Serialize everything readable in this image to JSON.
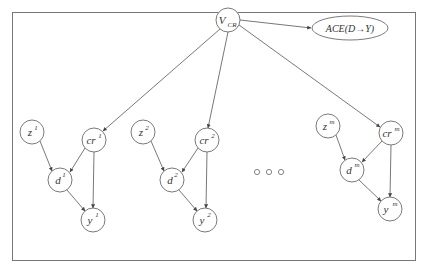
{
  "diagram": {
    "type": "causal-graph",
    "root": {
      "id": "vcr",
      "label": "V",
      "sub": "CR"
    },
    "target": {
      "id": "ace",
      "label": "ACE(D→Y)"
    },
    "groups": [
      {
        "z": {
          "base": "z",
          "sup": "1"
        },
        "cr": {
          "base": "cr",
          "sup": "1"
        },
        "d": {
          "base": "d",
          "sup": "1"
        },
        "y": {
          "base": "y",
          "sup": "1"
        }
      },
      {
        "z": {
          "base": "z",
          "sup": "2"
        },
        "cr": {
          "base": "cr",
          "sup": "2"
        },
        "d": {
          "base": "d",
          "sup": "2"
        },
        "y": {
          "base": "y",
          "sup": "2"
        }
      },
      {
        "z": {
          "base": "z",
          "sup": "m"
        },
        "cr": {
          "base": "cr",
          "sup": "m"
        },
        "d": {
          "base": "d",
          "sup": "m"
        },
        "y": {
          "base": "y",
          "sup": "m"
        }
      }
    ],
    "ellipsis": "○ ○ ○",
    "edges": [
      [
        "V_CR",
        "ACE(D→Y)"
      ],
      [
        "V_CR",
        "cr^1"
      ],
      [
        "V_CR",
        "cr^2"
      ],
      [
        "V_CR",
        "cr^m"
      ],
      [
        "z^1",
        "d^1"
      ],
      [
        "cr^1",
        "d^1"
      ],
      [
        "cr^1",
        "y^1"
      ],
      [
        "d^1",
        "y^1"
      ],
      [
        "z^2",
        "d^2"
      ],
      [
        "cr^2",
        "d^2"
      ],
      [
        "cr^2",
        "y^2"
      ],
      [
        "d^2",
        "y^2"
      ],
      [
        "z^m",
        "d^m"
      ],
      [
        "cr^m",
        "d^m"
      ],
      [
        "cr^m",
        "y^m"
      ],
      [
        "d^m",
        "y^m"
      ]
    ]
  }
}
